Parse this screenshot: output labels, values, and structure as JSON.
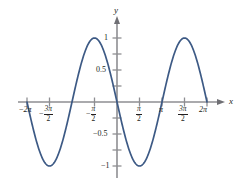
{
  "chart_data": {
    "type": "line",
    "title": "",
    "xlabel": "x",
    "ylabel": "y",
    "function": "y = -sin(x)",
    "xlim": [
      -6.283185307,
      6.283185307
    ],
    "ylim": [
      -1.25,
      1.25
    ],
    "grid": false,
    "legend": null,
    "x_tick_labels": [
      "-2π",
      "-3π/2",
      "-π/2",
      "π/2",
      "π",
      "3π/2",
      "2π"
    ],
    "x_tick_values": [
      -6.283185307,
      -4.71238898,
      -1.570796327,
      1.570796327,
      3.141592654,
      4.71238898,
      6.283185307
    ],
    "y_tick_labels": [
      "1",
      "0.5",
      "-0.5",
      "-1"
    ],
    "y_tick_values": [
      1,
      0.5,
      -0.5,
      -1
    ],
    "series": [
      {
        "name": "y = -sin(x)",
        "color": "#3d5a85",
        "x": [
          -6.283185307,
          -5.890486225,
          -5.497787144,
          -5.105088062,
          -4.71238898,
          -4.319689899,
          -3.926990817,
          -3.534291735,
          -3.141592654,
          -2.748893572,
          -2.35619449,
          -1.963495408,
          -1.570796327,
          -1.178097245,
          -0.785398163,
          -0.392699082,
          0,
          0.392699082,
          0.785398163,
          1.178097245,
          1.570796327,
          1.963495408,
          2.35619449,
          2.748893572,
          3.141592654,
          3.534291735,
          3.926990817,
          4.319689899,
          4.71238898,
          5.105088062,
          5.497787144,
          5.890486225,
          6.283185307
        ],
        "y": [
          0,
          0.382683432,
          0.707106781,
          0.923879533,
          1,
          0.923879533,
          0.707106781,
          0.382683432,
          0,
          -0.382683432,
          -0.707106781,
          -0.923879533,
          -1,
          -0.923879533,
          -0.707106781,
          -0.382683432,
          0,
          0.382683432,
          0.707106781,
          0.923879533,
          1,
          0.923879533,
          0.707106781,
          0.382683432,
          0,
          -0.382683432,
          -0.707106781,
          -0.923879533,
          -1,
          -0.923879533,
          -0.707106781,
          -0.382683432,
          0
        ]
      }
    ],
    "maxima": [
      {
        "x": "-3π/2",
        "y": 1
      },
      {
        "x": "π/2",
        "y": 1
      }
    ],
    "minima": [
      {
        "x": "-π/2",
        "y": -1
      },
      {
        "x": "3π/2",
        "y": -1
      }
    ],
    "zero_crossings": [
      "-2π",
      "-π",
      "0",
      "π",
      "2π"
    ]
  },
  "axes": {
    "x_axis_label": "x",
    "y_axis_label": "y",
    "axis_color": "#8e8e92",
    "curve_color": "#3d5a85",
    "background": "#ffffff"
  },
  "x_ticks": [
    {
      "id": "neg-two-pi",
      "minus": "−",
      "text": "2π",
      "fraction": false
    },
    {
      "id": "neg-three-pi-over-two",
      "minus": "−",
      "num": "3π",
      "den": "2",
      "fraction": true
    },
    {
      "id": "neg-pi-over-two",
      "minus": "−",
      "num": "π",
      "den": "2",
      "fraction": true
    },
    {
      "id": "pi-over-two",
      "minus": "",
      "num": "π",
      "den": "2",
      "fraction": true
    },
    {
      "id": "pi",
      "minus": "",
      "text": "π",
      "fraction": false
    },
    {
      "id": "three-pi-over-two",
      "minus": "",
      "num": "3π",
      "den": "2",
      "fraction": true
    },
    {
      "id": "two-pi",
      "minus": "",
      "text": "2π",
      "fraction": false
    }
  ],
  "y_ticks": [
    {
      "id": "one",
      "label": "1"
    },
    {
      "id": "half",
      "label": "0.5"
    },
    {
      "id": "neg-half",
      "label": "−0.5"
    },
    {
      "id": "neg-one",
      "label": "−1"
    }
  ]
}
